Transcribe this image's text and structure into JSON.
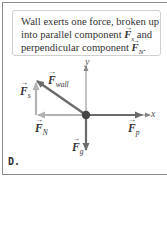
{
  "callout": {
    "line1": "Wall exerts one force, broken up",
    "line2_prefix": "into parallel component ",
    "line2_vec": "F",
    "line2_sub": "s",
    "line2_suffix": " and",
    "line3_prefix": "perpendicular component ",
    "line3_vec": "F",
    "line3_sub": "N",
    "line3_suffix": "."
  },
  "axes": {
    "x_label": "x",
    "y_label": "y"
  },
  "forces": [
    {
      "id": "F_wall",
      "symbol": "F",
      "subscript": "wall",
      "color": "#6b6b6b"
    },
    {
      "id": "F_s",
      "symbol": "F",
      "subscript": "s",
      "color": "#b3b3b3"
    },
    {
      "id": "F_N",
      "symbol": "F",
      "subscript": "N",
      "color": "#b3b3b3"
    },
    {
      "id": "F_g",
      "symbol": "F",
      "subscript": "g",
      "color": "#6b6b6b"
    },
    {
      "id": "F_p",
      "symbol": "F",
      "subscript": "p",
      "color": "#6b6b6b"
    }
  ],
  "colors": {
    "frame": "#8a8a8a",
    "callout_border": "#cfcfcf",
    "dark_arrow": "#6b6b6b",
    "light_arrow": "#b3b3b3",
    "origin_dot": "#444444"
  },
  "panel_letter": "D.",
  "arrow_glyph": "→"
}
